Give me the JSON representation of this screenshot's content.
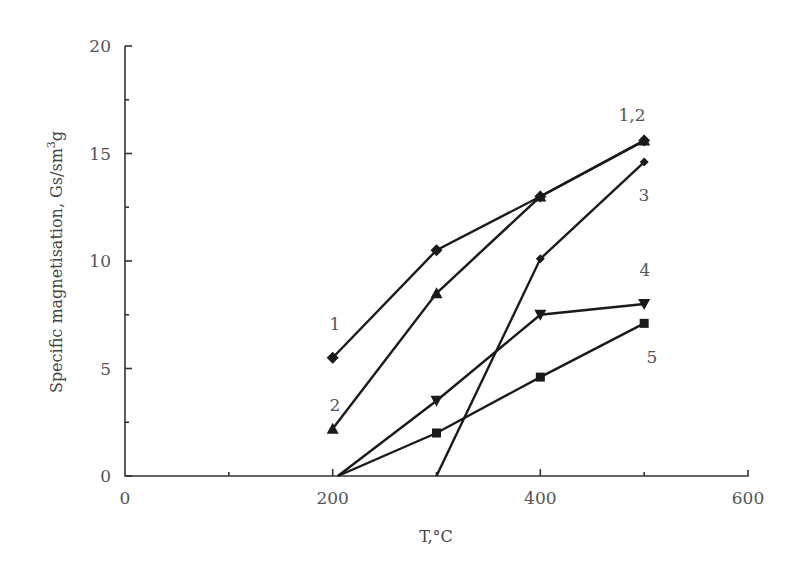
{
  "chart_data": {
    "type": "line",
    "title": "",
    "xlabel": "T,°C",
    "ylabel": "Specific magnetisation, Gs/sm³g",
    "xlim": [
      0,
      600
    ],
    "ylim": [
      0,
      20
    ],
    "x_ticks": [
      "0",
      "200",
      "400",
      "600"
    ],
    "y_ticks": [
      "0",
      "5",
      "10",
      "15",
      "20"
    ],
    "grid": false,
    "legend": "inline labels near curves",
    "series": [
      {
        "name": "1",
        "marker": "diamond",
        "x": [
          200,
          300,
          400,
          500
        ],
        "values": [
          5.5,
          10.5,
          13.0,
          15.6
        ]
      },
      {
        "name": "2",
        "marker": "triangle-up",
        "x": [
          200,
          300,
          400,
          500
        ],
        "values": [
          2.2,
          8.5,
          13.0,
          15.6
        ]
      },
      {
        "name": "3",
        "marker": "small-diamond",
        "x": [
          300,
          400,
          500
        ],
        "values": [
          0,
          10.1,
          14.6
        ]
      },
      {
        "name": "4",
        "marker": "triangle-down",
        "x": [
          205,
          300,
          400,
          500
        ],
        "values": [
          0,
          3.5,
          7.5,
          8.0
        ]
      },
      {
        "name": "5",
        "marker": "square",
        "x": [
          205,
          300,
          400,
          500
        ],
        "values": [
          0,
          2.0,
          4.6,
          7.1
        ]
      }
    ],
    "annotations": [
      "1",
      "2",
      "1,2",
      "3",
      "4",
      "5"
    ]
  }
}
